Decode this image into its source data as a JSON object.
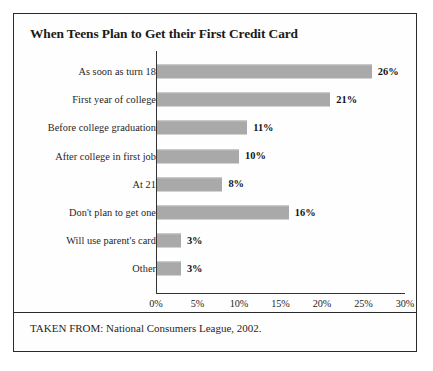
{
  "page": {
    "bleed_text": "                               "
  },
  "figure": {
    "title": "When Teens Plan to Get their First Credit Card",
    "source_note": "TAKEN FROM: National Consumers League, 2002."
  },
  "chart_data": {
    "type": "bar",
    "orientation": "horizontal",
    "title": "When Teens Plan to Get their First Credit Card",
    "xlabel": "",
    "ylabel": "",
    "xlim": [
      0,
      30
    ],
    "xticks": [
      "0%",
      "5%",
      "10%",
      "15%",
      "20%",
      "25%",
      "30%"
    ],
    "xtick_values": [
      0,
      5,
      10,
      15,
      20,
      25,
      30
    ],
    "grid": false,
    "legend": "none",
    "bar_color": "#a9a9a9",
    "categories": [
      "As soon as turn 18",
      "First year of college",
      "Before college graduation",
      "After college in first job",
      "At 21",
      "Don't plan to get one",
      "Will use parent's card",
      "Other"
    ],
    "values": [
      26,
      21,
      11,
      10,
      8,
      16,
      3,
      3
    ],
    "value_labels": [
      "26%",
      "21%",
      "11%",
      "10%",
      "8%",
      "16%",
      "3%",
      "3%"
    ]
  }
}
